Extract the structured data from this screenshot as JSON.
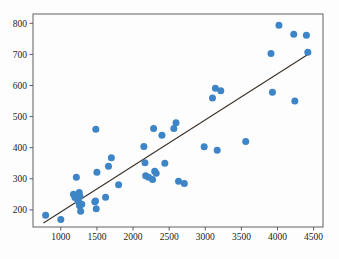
{
  "chart_data": {
    "type": "scatter",
    "title": "",
    "xlabel": "",
    "ylabel": "",
    "xlim": [
      615,
      4630
    ],
    "ylim": [
      145,
      830
    ],
    "grid": false,
    "legend": null,
    "xticks": [
      1000,
      1500,
      2000,
      2500,
      3000,
      3500,
      4000,
      4500
    ],
    "yticks": [
      200,
      300,
      400,
      500,
      600,
      700,
      800
    ],
    "xtick_labels": [
      "1000",
      "1500",
      "2000",
      "2500",
      "3000",
      "3500",
      "4000",
      "4500"
    ],
    "ytick_labels": [
      "200",
      "300",
      "400",
      "500",
      "600",
      "700",
      "800"
    ],
    "marker_color": "#3d85c6",
    "marker_size": 4.6,
    "series": [
      {
        "name": "observations",
        "points": [
          [
            790,
            183
          ],
          [
            1000,
            169
          ],
          [
            1175,
            250
          ],
          [
            1195,
            240
          ],
          [
            1215,
            305
          ],
          [
            1235,
            232
          ],
          [
            1250,
            224
          ],
          [
            1255,
            256
          ],
          [
            1260,
            213
          ],
          [
            1265,
            244
          ],
          [
            1275,
            196
          ],
          [
            1290,
            218
          ],
          [
            1470,
            226
          ],
          [
            1480,
            229
          ],
          [
            1485,
            459
          ],
          [
            1490,
            204
          ],
          [
            1500,
            321
          ],
          [
            1620,
            241
          ],
          [
            1660,
            340
          ],
          [
            1700,
            368
          ],
          [
            1800,
            281
          ],
          [
            2150,
            404
          ],
          [
            2165,
            352
          ],
          [
            2175,
            310
          ],
          [
            2215,
            305
          ],
          [
            2270,
            298
          ],
          [
            2285,
            462
          ],
          [
            2300,
            324
          ],
          [
            2320,
            318
          ],
          [
            2400,
            440
          ],
          [
            2440,
            350
          ],
          [
            2565,
            462
          ],
          [
            2595,
            480
          ],
          [
            2630,
            292
          ],
          [
            2710,
            285
          ],
          [
            2985,
            403
          ],
          [
            3100,
            560
          ],
          [
            3140,
            591
          ],
          [
            3165,
            392
          ],
          [
            3215,
            583
          ],
          [
            3560,
            420
          ],
          [
            3910,
            703
          ],
          [
            3930,
            578
          ],
          [
            4020,
            794
          ],
          [
            4225,
            765
          ],
          [
            4240,
            550
          ],
          [
            4400,
            762
          ],
          [
            4420,
            707
          ]
        ]
      }
    ],
    "trend_line": {
      "name": "least-squares fit",
      "color": "#3a3028",
      "start": [
        760,
        158
      ],
      "end": [
        4420,
        700
      ]
    }
  }
}
